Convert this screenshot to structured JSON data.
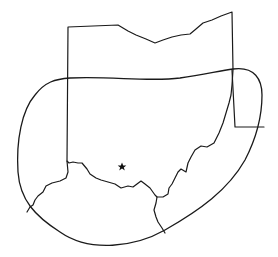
{
  "map": {
    "width": 278,
    "height": 257,
    "background": "#ffffff",
    "stroke_color": "#1a1a1a",
    "features": {
      "state_outline": {
        "name": "ohio-outline",
        "path": "M68 27 L118 25 L128 31 L136 35 L146 39 L155 43 L163 40 L172 37 L181 35 L190 34 L196 29 L203 23 L212 20 L221 16 L232 12 L233 70 L232 85 L231 95 L229 103 L226 113 L223 123 L219 133 L214 143 L207 147 L201 146 L195 150 L191 157 L188 163 L186 172 L181 169 L178 172 L175 178 L172 184 L169 188 L168 194 L163 197 L157 197 L155 195 L150 188 L145 184 L141 181 L137 184 L133 187 L128 186 L121 188 L115 184 L108 182 L101 180 L96 178 L90 174 L87 169 L82 163 L78 163 L73 162 L69 163 L67 161 L68 27 Z"
      },
      "pennsylvania_border": {
        "name": "pa-border",
        "path": "M232 70 L235 127 L264 127"
      },
      "indiana_kentucky_border": {
        "name": "in-ky-border",
        "path": "M67 161 L68 172 L66 178 L60 181 L52 183 L46 186 L43 192 L38 196 L35 200 L33 205 L30 207 L27 212"
      },
      "ky_wv_border": {
        "name": "ky-wv-border",
        "path": "M157 197 L156 203 L154 210 L156 217 L158 222 L162 228 L165 233"
      },
      "coverage_contour": {
        "name": "coverage-contour",
        "path": "M233 69 C255 66 262 80 262 95 C262 115 258 135 245 160 C228 190 200 210 165 230 C135 247 90 253 60 232 C35 216 20 200 18 172 C16 140 22 110 35 95 C45 82 55 79 70 78 C110 76 150 82 180 78 C205 74 220 71 233 69 Z"
      },
      "city_marker": {
        "name": "star-marker",
        "cx": 122,
        "cy": 167,
        "r": 3
      }
    }
  }
}
